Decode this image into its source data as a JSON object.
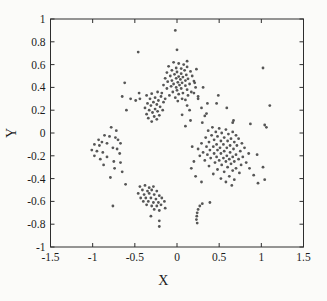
{
  "figure": {
    "background": "#fbfbf9",
    "axis_color": "#2e2e2e",
    "tick_label_color": "#1c1c1c",
    "point_color": "#3f3f3f"
  },
  "chart_data": {
    "type": "scatter",
    "title": "",
    "xlabel": "X",
    "ylabel": "Y",
    "xlim": [
      -1.5,
      1.5
    ],
    "ylim": [
      -1,
      1
    ],
    "grid": false,
    "legend": null,
    "x_ticks": [
      -1.5,
      -1,
      -0.5,
      0,
      0.5,
      1,
      1.5
    ],
    "x_tick_labels": [
      "-1.5",
      "-1",
      "-0.5",
      "0",
      "0.5",
      "1",
      "1.5"
    ],
    "y_ticks": [
      -1,
      -0.8,
      -0.6,
      -0.4,
      -0.2,
      0,
      0.2,
      0.4,
      0.6,
      0.8,
      1
    ],
    "y_tick_labels": [
      "-1",
      "-0.8",
      "-0.6",
      "-0.4",
      "-0.2",
      "0",
      "0.2",
      "0.4",
      "0.6",
      "0.8",
      "1"
    ],
    "marker": {
      "shape": "dot",
      "radius_px": 1.4,
      "color": "#3f3f3f"
    },
    "points": [
      [
        -0.02,
        0.9
      ],
      [
        0.0,
        0.73
      ],
      [
        -0.46,
        0.71
      ],
      [
        0.12,
        0.63
      ],
      [
        1.02,
        0.57
      ],
      [
        0.23,
        0.56
      ],
      [
        -0.04,
        0.62
      ],
      [
        0.02,
        0.61
      ],
      [
        0.08,
        0.6
      ],
      [
        -0.1,
        0.585
      ],
      [
        0.12,
        0.58
      ],
      [
        -0.01,
        0.57
      ],
      [
        0.05,
        0.565
      ],
      [
        -0.06,
        0.55
      ],
      [
        0.09,
        0.55
      ],
      [
        0.16,
        0.54
      ],
      [
        -0.12,
        0.53
      ],
      [
        0.0,
        0.535
      ],
      [
        0.05,
        0.52
      ],
      [
        -0.03,
        0.515
      ],
      [
        0.11,
        0.51
      ],
      [
        0.18,
        0.5
      ],
      [
        -0.08,
        0.5
      ],
      [
        0.02,
        0.495
      ],
      [
        0.07,
        0.49
      ],
      [
        -0.14,
        0.48
      ],
      [
        -0.01,
        0.48
      ],
      [
        0.13,
        0.475
      ],
      [
        0.04,
        0.47
      ],
      [
        -0.06,
        0.46
      ],
      [
        0.1,
        0.46
      ],
      [
        0.2,
        0.455
      ],
      [
        -0.11,
        0.45
      ],
      [
        0.01,
        0.445
      ],
      [
        0.06,
        0.44
      ],
      [
        -0.04,
        0.43
      ],
      [
        0.15,
        0.43
      ],
      [
        -0.16,
        0.42
      ],
      [
        0.03,
        0.42
      ],
      [
        0.1,
        0.415
      ],
      [
        -0.07,
        0.41
      ],
      [
        0.22,
        0.4
      ],
      [
        -0.01,
        0.4
      ],
      [
        0.05,
        0.39
      ],
      [
        -0.12,
        0.39
      ],
      [
        0.12,
        0.38
      ],
      [
        0.0,
        0.375
      ],
      [
        -0.05,
        0.36
      ],
      [
        0.17,
        0.36
      ],
      [
        0.07,
        0.35
      ],
      [
        -0.18,
        0.35
      ],
      [
        0.02,
        0.34
      ],
      [
        -0.09,
        0.33
      ],
      [
        0.13,
        0.33
      ],
      [
        0.25,
        0.32
      ],
      [
        -0.02,
        0.31
      ],
      [
        0.06,
        0.3
      ],
      [
        -0.14,
        0.3
      ],
      [
        0.1,
        0.29
      ],
      [
        0.01,
        0.28
      ],
      [
        -0.23,
        0.36
      ],
      [
        -0.3,
        0.345
      ],
      [
        -0.36,
        0.33
      ],
      [
        -0.19,
        0.32
      ],
      [
        -0.26,
        0.31
      ],
      [
        -0.32,
        0.3
      ],
      [
        -0.44,
        0.3
      ],
      [
        -0.22,
        0.285
      ],
      [
        -0.28,
        0.27
      ],
      [
        -0.16,
        0.27
      ],
      [
        -0.35,
        0.26
      ],
      [
        -0.24,
        0.25
      ],
      [
        -0.31,
        0.24
      ],
      [
        -0.2,
        0.23
      ],
      [
        -0.38,
        0.22
      ],
      [
        -0.26,
        0.21
      ],
      [
        -0.33,
        0.2
      ],
      [
        -0.17,
        0.2
      ],
      [
        -0.23,
        0.19
      ],
      [
        -0.29,
        0.18
      ],
      [
        -0.36,
        0.165
      ],
      [
        -0.21,
        0.155
      ],
      [
        -0.27,
        0.145
      ],
      [
        -0.34,
        0.13
      ],
      [
        -0.24,
        0.12
      ],
      [
        -0.3,
        0.1
      ],
      [
        -0.62,
        0.44
      ],
      [
        -0.65,
        0.32
      ],
      [
        -0.55,
        0.3
      ],
      [
        -0.49,
        0.285
      ],
      [
        -0.6,
        0.2
      ],
      [
        -0.45,
        0.35
      ],
      [
        0.2,
        0.35
      ],
      [
        0.25,
        0.3
      ],
      [
        0.29,
        0.22
      ],
      [
        0.33,
        0.15
      ],
      [
        0.21,
        0.44
      ],
      [
        0.31,
        0.4
      ],
      [
        0.12,
        0.24
      ],
      [
        0.15,
        0.2
      ],
      [
        0.06,
        0.16
      ],
      [
        0.1,
        0.06
      ],
      [
        0.16,
        0.11
      ],
      [
        0.35,
        0.17
      ],
      [
        0.3,
        0.09
      ],
      [
        1.1,
        0.24
      ],
      [
        0.66,
        0.09
      ],
      [
        0.87,
        0.08
      ],
      [
        1.04,
        0.07
      ],
      [
        0.49,
        0.33
      ],
      [
        0.47,
        0.26
      ],
      [
        0.59,
        0.22
      ],
      [
        0.67,
        0.11
      ],
      [
        0.36,
        0.26
      ],
      [
        0.42,
        0.05
      ],
      [
        0.5,
        0.04
      ],
      [
        0.58,
        0.03
      ],
      [
        0.37,
        0.02
      ],
      [
        0.46,
        0.01
      ],
      [
        0.66,
        0.01
      ],
      [
        0.53,
        0.0
      ],
      [
        0.61,
        -0.01
      ],
      [
        0.41,
        -0.02
      ],
      [
        0.7,
        -0.02
      ],
      [
        0.48,
        -0.03
      ],
      [
        0.56,
        -0.04
      ],
      [
        0.34,
        -0.04
      ],
      [
        0.64,
        -0.05
      ],
      [
        0.73,
        -0.05
      ],
      [
        0.44,
        -0.06
      ],
      [
        0.52,
        -0.07
      ],
      [
        0.6,
        -0.07
      ],
      [
        0.38,
        -0.08
      ],
      [
        0.68,
        -0.08
      ],
      [
        0.77,
        -0.09
      ],
      [
        0.29,
        -0.09
      ],
      [
        0.47,
        -0.1
      ],
      [
        0.55,
        -0.1
      ],
      [
        0.63,
        -0.11
      ],
      [
        0.71,
        -0.11
      ],
      [
        0.35,
        -0.12
      ],
      [
        0.43,
        -0.12
      ],
      [
        0.51,
        -0.13
      ],
      [
        0.59,
        -0.13
      ],
      [
        0.8,
        -0.13
      ],
      [
        0.25,
        -0.14
      ],
      [
        0.67,
        -0.14
      ],
      [
        0.39,
        -0.15
      ],
      [
        0.48,
        -0.15
      ],
      [
        0.56,
        -0.16
      ],
      [
        0.75,
        -0.16
      ],
      [
        0.31,
        -0.17
      ],
      [
        0.63,
        -0.17
      ],
      [
        0.44,
        -0.18
      ],
      [
        0.52,
        -0.18
      ],
      [
        0.85,
        -0.18
      ],
      [
        0.7,
        -0.19
      ],
      [
        0.36,
        -0.19
      ],
      [
        0.59,
        -0.2
      ],
      [
        0.27,
        -0.2
      ],
      [
        0.47,
        -0.21
      ],
      [
        0.66,
        -0.21
      ],
      [
        0.78,
        -0.21
      ],
      [
        0.55,
        -0.22
      ],
      [
        0.4,
        -0.22
      ],
      [
        0.62,
        -0.23
      ],
      [
        0.73,
        -0.23
      ],
      [
        0.5,
        -0.24
      ],
      [
        0.33,
        -0.24
      ],
      [
        0.68,
        -0.25
      ],
      [
        0.58,
        -0.25
      ],
      [
        0.82,
        -0.26
      ],
      [
        0.45,
        -0.26
      ],
      [
        0.64,
        -0.27
      ],
      [
        0.53,
        -0.28
      ],
      [
        0.76,
        -0.28
      ],
      [
        0.38,
        -0.29
      ],
      [
        0.6,
        -0.3
      ],
      [
        0.7,
        -0.31
      ],
      [
        0.48,
        -0.32
      ],
      [
        0.66,
        -0.33
      ],
      [
        0.56,
        -0.34
      ],
      [
        0.74,
        -0.35
      ],
      [
        0.43,
        -0.36
      ],
      [
        0.62,
        -0.38
      ],
      [
        0.52,
        -0.4
      ],
      [
        0.68,
        -0.41
      ],
      [
        0.58,
        -0.43
      ],
      [
        0.65,
        -0.46
      ],
      [
        0.95,
        -0.19
      ],
      [
        1.02,
        -0.3
      ],
      [
        1.04,
        -0.41
      ],
      [
        0.96,
        -0.44
      ],
      [
        1.06,
        0.05
      ],
      [
        0.91,
        -0.37
      ],
      [
        0.86,
        -0.31
      ],
      [
        0.18,
        -0.12
      ],
      [
        0.2,
        -0.25
      ],
      [
        0.17,
        -0.31
      ],
      [
        0.29,
        -0.43
      ],
      [
        0.22,
        -0.38
      ],
      [
        -0.44,
        -0.47
      ],
      [
        -0.38,
        -0.46
      ],
      [
        -0.33,
        -0.48
      ],
      [
        -0.28,
        -0.47
      ],
      [
        -0.41,
        -0.5
      ],
      [
        -0.35,
        -0.51
      ],
      [
        -0.3,
        -0.5
      ],
      [
        -0.24,
        -0.51
      ],
      [
        -0.46,
        -0.53
      ],
      [
        -0.39,
        -0.54
      ],
      [
        -0.33,
        -0.53
      ],
      [
        -0.27,
        -0.54
      ],
      [
        -0.21,
        -0.55
      ],
      [
        -0.43,
        -0.57
      ],
      [
        -0.37,
        -0.57
      ],
      [
        -0.31,
        -0.57
      ],
      [
        -0.25,
        -0.58
      ],
      [
        -0.18,
        -0.57
      ],
      [
        -0.4,
        -0.6
      ],
      [
        -0.34,
        -0.6
      ],
      [
        -0.28,
        -0.61
      ],
      [
        -0.22,
        -0.61
      ],
      [
        -0.15,
        -0.6
      ],
      [
        -0.36,
        -0.63
      ],
      [
        -0.3,
        -0.64
      ],
      [
        -0.24,
        -0.64
      ],
      [
        -0.19,
        -0.63
      ],
      [
        -0.27,
        -0.67
      ],
      [
        -0.21,
        -0.68
      ],
      [
        -0.14,
        -0.66
      ],
      [
        -0.21,
        -0.77
      ],
      [
        -0.21,
        -0.82
      ],
      [
        -0.31,
        -0.73
      ],
      [
        -0.78,
        0.05
      ],
      [
        -0.72,
        0.02
      ],
      [
        -0.86,
        -0.02
      ],
      [
        -0.8,
        -0.03
      ],
      [
        -0.73,
        -0.04
      ],
      [
        -0.7,
        -0.06
      ],
      [
        -0.93,
        -0.06
      ],
      [
        -0.89,
        -0.08
      ],
      [
        -0.83,
        -0.09
      ],
      [
        -0.67,
        -0.09
      ],
      [
        -0.98,
        -0.1
      ],
      [
        -0.92,
        -0.11
      ],
      [
        -0.76,
        -0.13
      ],
      [
        -0.71,
        -0.14
      ],
      [
        -1.01,
        -0.15
      ],
      [
        -0.95,
        -0.16
      ],
      [
        -0.88,
        -0.17
      ],
      [
        -0.68,
        -0.18
      ],
      [
        -0.98,
        -0.2
      ],
      [
        -0.83,
        -0.21
      ],
      [
        -0.91,
        -0.23
      ],
      [
        -0.75,
        -0.25
      ],
      [
        -0.67,
        -0.26
      ],
      [
        -0.87,
        -0.28
      ],
      [
        -0.74,
        -0.31
      ],
      [
        -0.65,
        -0.34
      ],
      [
        -0.79,
        -0.39
      ],
      [
        -0.61,
        -0.45
      ],
      [
        -0.76,
        -0.64
      ],
      [
        0.3,
        -0.62
      ],
      [
        0.27,
        -0.64
      ],
      [
        0.25,
        -0.67
      ],
      [
        0.24,
        -0.7
      ],
      [
        0.235,
        -0.73
      ],
      [
        0.23,
        -0.76
      ],
      [
        0.24,
        -0.79
      ],
      [
        0.39,
        -0.61
      ]
    ]
  }
}
